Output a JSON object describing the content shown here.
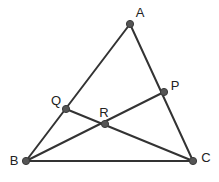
{
  "figure": {
    "width": 219,
    "height": 182,
    "background_color": "#ffffff",
    "line_color": "#333333",
    "point_color": "#555555",
    "label_color": "#222222",
    "line_width": 2,
    "point_radius": 3.6
  },
  "points": {
    "A": {
      "label": "A",
      "x": 130,
      "y": 24,
      "label_x": 140,
      "label_y": 14
    },
    "B": {
      "label": "B",
      "x": 26,
      "y": 161,
      "label_x": 14,
      "label_y": 162
    },
    "C": {
      "label": "C",
      "x": 193,
      "y": 161,
      "label_x": 206,
      "label_y": 159
    },
    "P": {
      "label": "P",
      "x": 164,
      "y": 92,
      "label_x": 175,
      "label_y": 87
    },
    "Q": {
      "label": "Q",
      "x": 66,
      "y": 109,
      "label_x": 56,
      "label_y": 102
    },
    "R": {
      "label": "R",
      "x": 105,
      "y": 124,
      "label_x": 104,
      "label_y": 114
    }
  },
  "segments": [
    {
      "name": "side-AB",
      "from": "A",
      "to": "B"
    },
    {
      "name": "side-AC",
      "from": "A",
      "to": "C"
    },
    {
      "name": "side-BC",
      "from": "B",
      "to": "C"
    },
    {
      "name": "cevian-BP",
      "from": "B",
      "to": "P"
    },
    {
      "name": "cevian-QC",
      "from": "Q",
      "to": "C"
    }
  ]
}
